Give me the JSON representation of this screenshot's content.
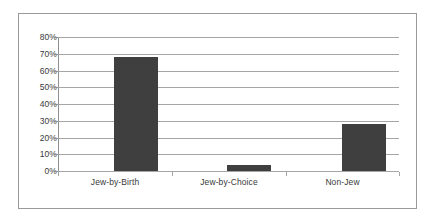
{
  "chart_data": {
    "type": "bar",
    "title": "",
    "subtitle": "",
    "xlabel": "",
    "ylabel": "",
    "categories": [
      "Jew-by-Birth",
      "Jew-by-Choice",
      "Non-Jew"
    ],
    "values": [
      68,
      3.5,
      28
    ],
    "value_labels": [
      "68%",
      "3.5%",
      "28%"
    ],
    "series": [
      {
        "name": "",
        "values": [
          68,
          3.5,
          28
        ]
      }
    ],
    "ylim": [
      0,
      80
    ],
    "ytick_step": 10,
    "ytick_labels": [
      "80%",
      "70%",
      "60%",
      "50%",
      "40%",
      "30%",
      "20%",
      "10%",
      "0%"
    ],
    "ytick_values": [
      80,
      70,
      60,
      50,
      40,
      30,
      20,
      10,
      0
    ],
    "grid": true,
    "grid_axis": "y",
    "legend": false,
    "legend_position": "none",
    "annotations": [],
    "colors": {
      "bar_fill": "#3f3f3f",
      "gridline": "#a6a6a6",
      "axis": "#8f8f8f",
      "frame_border": "#9a9a9a",
      "plot_background": "#ffffff",
      "text": "#3a3a3a"
    }
  }
}
